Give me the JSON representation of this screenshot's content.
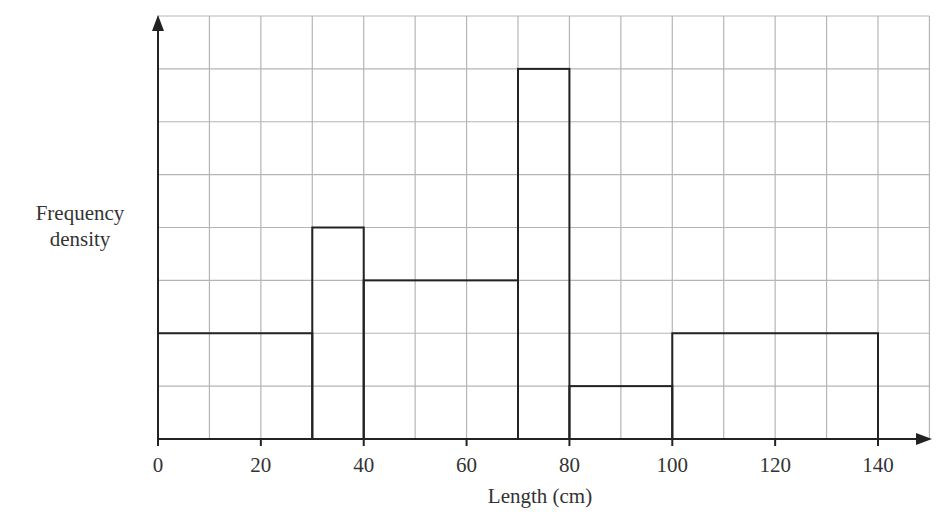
{
  "chart_data": {
    "type": "histogram",
    "title": "",
    "xlabel": "Length (cm)",
    "ylabel": "Frequency density",
    "x_ticks": [
      0,
      20,
      40,
      60,
      80,
      100,
      120,
      140
    ],
    "x_tick_labels": [
      "0",
      "20",
      "40",
      "60",
      "80",
      "100",
      "120",
      "140"
    ],
    "xlim": [
      0,
      150
    ],
    "ylim_grid_units": [
      0,
      8
    ],
    "y_ticks_labeled": false,
    "grid": true,
    "grid_x_step": 10,
    "grid_y_step": 1,
    "bins": [
      {
        "from": 0,
        "to": 30,
        "height": 2
      },
      {
        "from": 30,
        "to": 40,
        "height": 4
      },
      {
        "from": 40,
        "to": 70,
        "height": 3
      },
      {
        "from": 70,
        "to": 80,
        "height": 7
      },
      {
        "from": 80,
        "to": 100,
        "height": 1
      },
      {
        "from": 100,
        "to": 140,
        "height": 2
      }
    ],
    "categories": [
      "0-30",
      "30-40",
      "40-70",
      "70-80",
      "80-100",
      "100-140"
    ],
    "values": [
      2,
      4,
      3,
      7,
      1,
      2
    ],
    "legend": null
  },
  "labels": {
    "ylabel_line1": "Frequency",
    "ylabel_line2": "density",
    "xlabel": "Length (cm)"
  },
  "colors": {
    "grid": "#b5b5b5",
    "bars": "#222222",
    "axis": "#222222",
    "text": "#333333"
  }
}
